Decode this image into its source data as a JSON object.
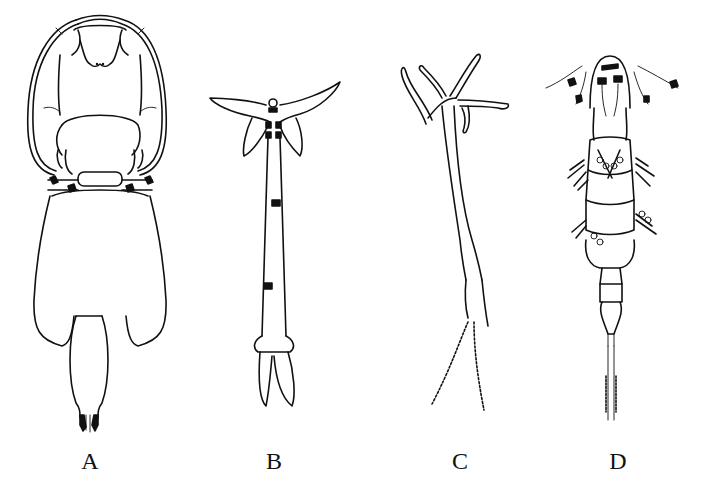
{
  "figure": {
    "panels": [
      {
        "id": "A",
        "label": "A",
        "description": "Copepod with large rounded lateral carapace lobes, broad oval body and short tail segment"
      },
      {
        "id": "B",
        "label": "B",
        "description": "Elongate slender copepod with short curved anterior horns and two caudal lobes"
      },
      {
        "id": "C",
        "label": "C",
        "description": "Elongate copepod with branched anterior processes and paired egg strings"
      },
      {
        "id": "D",
        "label": "D",
        "description": "Free-living cyclopoid-type copepod with setose antennae and swimming legs"
      }
    ],
    "colors": {
      "line": "#111111",
      "background": "#ffffff"
    }
  }
}
